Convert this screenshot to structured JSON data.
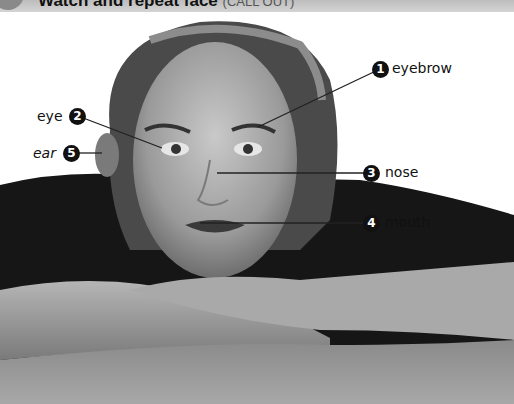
{
  "header": {
    "title": "Watch and repeat face",
    "subtitle": "(CALL OUT)"
  },
  "labels": [
    {
      "number": "1",
      "text": "eyebrow",
      "italic": false
    },
    {
      "number": "2",
      "text": "eye",
      "italic": false
    },
    {
      "number": "3",
      "text": "nose",
      "italic": false
    },
    {
      "number": "4",
      "text": "mouth",
      "italic": false
    },
    {
      "number": "5",
      "text": "ear",
      "italic": true
    }
  ],
  "colors": {
    "label_circle": "#111111",
    "leader_line": "#222222",
    "header_band": "#c8c8c8"
  }
}
